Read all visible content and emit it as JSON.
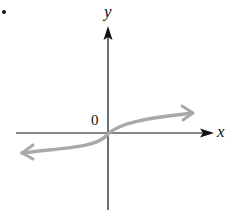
{
  "diagram": {
    "type": "function-graph",
    "axes": {
      "x_label": "x",
      "y_label": "y",
      "origin_label": "0"
    },
    "curve": {
      "shape": "cube-root-like increasing curve through origin",
      "color": "#a9a9a9",
      "arrows_both_ends": true
    },
    "axis_color": "#111111",
    "marker": "."
  }
}
